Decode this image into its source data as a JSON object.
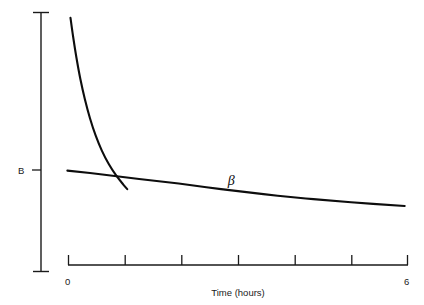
{
  "chart_data": {
    "type": "line",
    "title": "",
    "subtitle": "",
    "xlabel": "Time (hours)",
    "ylabel": "",
    "xlim": [
      0,
      6
    ],
    "ylim": [
      0,
      1
    ],
    "grid": false,
    "legend_position": "inline-annotation",
    "x_tick_values": [
      0,
      1,
      2,
      3,
      4,
      5,
      6
    ],
    "x_tick_labels": [
      "0",
      "",
      "",
      "",
      "",
      "",
      "6"
    ],
    "y_tick_values": [
      0.36
    ],
    "y_tick_labels": [
      "B"
    ],
    "annotations": [
      {
        "text": "β",
        "x": 2.82,
        "y": 0.315,
        "name": "beta-phase-label"
      }
    ],
    "series": [
      {
        "name": "alpha-phase",
        "label": "",
        "color": "#0d0d0d",
        "points": [
          {
            "x": 0.035,
            "y": 0.977
          },
          {
            "x": 0.08,
            "y": 0.905
          },
          {
            "x": 0.14,
            "y": 0.82
          },
          {
            "x": 0.21,
            "y": 0.735
          },
          {
            "x": 0.29,
            "y": 0.655
          },
          {
            "x": 0.38,
            "y": 0.58
          },
          {
            "x": 0.48,
            "y": 0.512
          },
          {
            "x": 0.59,
            "y": 0.452
          },
          {
            "x": 0.71,
            "y": 0.4
          },
          {
            "x": 0.84,
            "y": 0.355
          },
          {
            "x": 0.97,
            "y": 0.318
          },
          {
            "x": 1.04,
            "y": 0.3
          }
        ]
      },
      {
        "name": "beta-phase",
        "label": "β",
        "color": "#0d0d0d",
        "points": [
          {
            "x": -0.02,
            "y": 0.373
          },
          {
            "x": 0.6,
            "y": 0.358
          },
          {
            "x": 1.25,
            "y": 0.34
          },
          {
            "x": 1.95,
            "y": 0.322
          },
          {
            "x": 2.7,
            "y": 0.3
          },
          {
            "x": 3.45,
            "y": 0.28
          },
          {
            "x": 4.2,
            "y": 0.263
          },
          {
            "x": 5.0,
            "y": 0.248
          },
          {
            "x": 5.95,
            "y": 0.233
          }
        ]
      }
    ]
  },
  "axes": {
    "y_axis_name": "concentration-axis",
    "x_axis_name": "time-axis",
    "x_title": "Time (hours)",
    "x_label_left": "0",
    "x_label_right": "6",
    "y_label_b": "B"
  },
  "colors": {
    "background": "#ffffff",
    "axis": "#1a1a1a",
    "curve": "#0d0d0d",
    "text": "#1a1a1a"
  }
}
